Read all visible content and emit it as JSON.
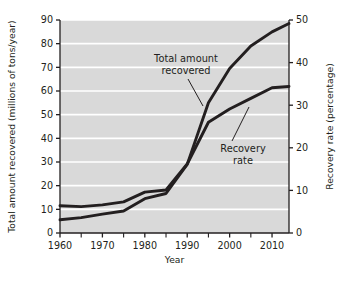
{
  "chart_data": {
    "type": "line",
    "title": "",
    "xlabel": "Year",
    "ylabel": "Total amount recovered (millions of tons/year)",
    "y2label": "Recovery rate (percentage)",
    "xlim": [
      1960,
      2014
    ],
    "ylim": [
      0,
      90
    ],
    "y2lim": [
      0,
      50
    ],
    "xticks": [
      1960,
      1970,
      1980,
      1990,
      2000,
      2010
    ],
    "xticks_minor": [
      1965,
      1975,
      1985,
      1995,
      2005
    ],
    "yticks": [
      0,
      10,
      20,
      30,
      40,
      50,
      60,
      70,
      80,
      90
    ],
    "y2ticks": [
      0,
      10,
      20,
      30,
      40,
      50
    ],
    "xtick_labels": [
      "1960",
      "1970",
      "1980",
      "1990",
      "2000",
      "2010"
    ],
    "ytick_labels": [
      "0",
      "10",
      "20",
      "30",
      "40",
      "50",
      "60",
      "70",
      "80",
      "90"
    ],
    "y2tick_labels": [
      "0",
      "10",
      "20",
      "30",
      "40",
      "50"
    ],
    "grid": "horizontal-white",
    "legend": "none",
    "plot_background": "#d9d9d9",
    "line_color": "#231f20",
    "series": [
      {
        "name": "Total amount recovered",
        "axis": "left",
        "units": "millions of tons/year",
        "x": [
          1960,
          1965,
          1970,
          1975,
          1980,
          1985,
          1990,
          1995,
          2000,
          2005,
          2010,
          2014
        ],
        "values": [
          5.6,
          6.5,
          8.0,
          9.3,
          14.5,
          16.7,
          29.0,
          55.0,
          69.5,
          79.0,
          85.0,
          88.5
        ]
      },
      {
        "name": "Recovery rate",
        "axis": "right",
        "units": "percentage",
        "x": [
          1960,
          1965,
          1970,
          1975,
          1980,
          1985,
          1990,
          1995,
          2000,
          2005,
          2010,
          2014
        ],
        "values": [
          6.4,
          6.2,
          6.6,
          7.3,
          9.6,
          10.1,
          16.2,
          26.0,
          29.1,
          31.6,
          34.1,
          34.4
        ]
      }
    ],
    "annotations": [
      {
        "name": "total-amount-annotation",
        "text_line1": "Total amount",
        "text_line2": "recovered",
        "target_series": "Total amount recovered"
      },
      {
        "name": "recovery-rate-annotation",
        "text_line1": "Recovery",
        "text_line2": "rate",
        "target_series": "Recovery rate"
      }
    ]
  }
}
